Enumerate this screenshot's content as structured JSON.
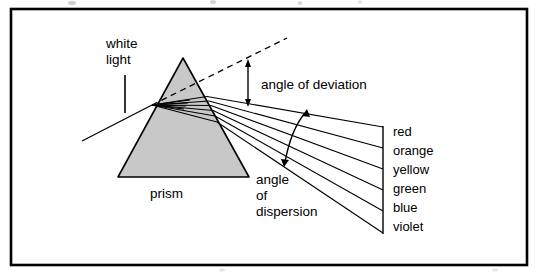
{
  "figure": {
    "title_visible": false,
    "frame": {
      "x": 11,
      "y": 9,
      "width": 516,
      "height": 256,
      "stroke_color": "#000000",
      "stroke_width": 2.5,
      "fill_color": "#ffffff"
    },
    "labels": {
      "white_light_line1": "white",
      "white_light_line2": "light",
      "prism": "prism",
      "angle_of_deviation": "angle of deviation",
      "angle_of_dispersion_line1": "angle",
      "angle_of_dispersion_line2": "of",
      "angle_of_dispersion_line3": "dispersion"
    },
    "spectrum": {
      "colors": [
        "red",
        "orange",
        "yellow",
        "green",
        "blue",
        "violet"
      ]
    },
    "prism_shape": {
      "apex": [
        183,
        58
      ],
      "bottom_left": [
        118,
        177
      ],
      "bottom_right": [
        249,
        177
      ],
      "fill_color": "#c8c8c8",
      "stroke_color": "#000000"
    },
    "incoming_ray": {
      "from": [
        82,
        140
      ],
      "to": [
        152,
        105
      ],
      "label": "white light incident ray"
    },
    "dashed_extension": {
      "from": [
        152,
        105
      ],
      "to": [
        286,
        38
      ],
      "style": "dashed"
    },
    "refraction_point_inside": [
      152,
      105
    ],
    "exit_face_points": [
      [
        206,
        97
      ],
      [
        208,
        101
      ],
      [
        210,
        105
      ],
      [
        212,
        110
      ],
      [
        214,
        115
      ],
      [
        216,
        121
      ]
    ],
    "ray_end_x": 383,
    "ray_end_y_values": [
      127,
      148,
      169,
      190,
      211,
      233
    ],
    "terminating_line": {
      "x": 383,
      "y_top": 127,
      "y_bottom": 233
    },
    "deviation_arrow": {
      "x": 248,
      "y_top": 62,
      "y_bottom": 104
    },
    "dispersion_arc": {
      "x_top": 306,
      "y_top": 112,
      "x_bottom": 284,
      "y_bottom": 164
    }
  },
  "colors": {
    "ink": "#000000",
    "prism_fill": "#c8c8c8",
    "page_background": "#ffffff"
  }
}
